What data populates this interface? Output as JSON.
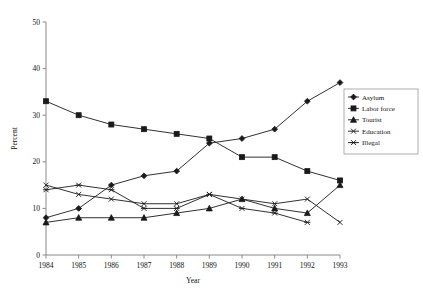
{
  "chart_data": {
    "type": "line",
    "title": "",
    "xlabel": "Year",
    "ylabel": "Percent",
    "categories": [
      "1984",
      "1985",
      "1986",
      "1987",
      "1988",
      "1989",
      "1990",
      "1991",
      "1992",
      "1993"
    ],
    "x": [
      1984,
      1985,
      1986,
      1987,
      1988,
      1989,
      1990,
      1991,
      1992,
      1993
    ],
    "xlim": [
      1984,
      1993
    ],
    "ylim": [
      0,
      50
    ],
    "yticks": [
      0,
      10,
      20,
      30,
      40,
      50
    ],
    "ytick_labels": [
      "0",
      "10",
      "20",
      "30",
      "40",
      "50"
    ],
    "xtick_labels": [
      "1984",
      "1985",
      "1986",
      "1987",
      "1988",
      "1989",
      "1990",
      "1991",
      "1992",
      "1993"
    ],
    "grid": false,
    "legend_position": "right",
    "series": [
      {
        "name": "Asylum",
        "marker": "diamond",
        "values": [
          8,
          10,
          15,
          17,
          18,
          24,
          25,
          27,
          33,
          37
        ]
      },
      {
        "name": "Labor force",
        "marker": "square",
        "values": [
          33,
          30,
          28,
          27,
          26,
          25,
          21,
          21,
          18,
          16
        ]
      },
      {
        "name": "Tourist",
        "marker": "triangle",
        "values": [
          7,
          8,
          8,
          8,
          9,
          10,
          12,
          10,
          9,
          15
        ]
      },
      {
        "name": "Education",
        "marker": "x",
        "values": [
          15,
          13,
          12,
          11,
          11,
          13,
          12,
          11,
          12,
          7
        ]
      },
      {
        "name": "Illegal",
        "marker": "asterisk",
        "values": [
          14,
          15,
          14,
          10,
          10,
          13,
          10,
          9,
          7,
          null
        ]
      }
    ]
  },
  "legend": {
    "entries": [
      {
        "label": "Asylum"
      },
      {
        "label": "Labor force"
      },
      {
        "label": "Tourist"
      },
      {
        "label": "Education"
      },
      {
        "label": "Illegal"
      }
    ]
  },
  "colors": {
    "ink": "#1a1a1a",
    "axis": "#8a8a8a",
    "background": "#ffffff",
    "legend_border": "#9a9a9a"
  }
}
